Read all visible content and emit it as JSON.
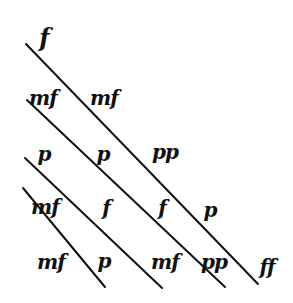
{
  "diagram": {
    "stroke_color": "#111111",
    "background": "#ffffff",
    "lines": [
      {
        "id": "line-1",
        "x1": 26,
        "y1": 44,
        "x2": 258,
        "y2": 284
      },
      {
        "id": "line-2",
        "x1": 27,
        "y1": 100,
        "x2": 225,
        "y2": 287
      },
      {
        "id": "line-3",
        "x1": 25,
        "y1": 158,
        "x2": 162,
        "y2": 288
      },
      {
        "id": "line-4",
        "x1": 23,
        "y1": 188,
        "x2": 105,
        "y2": 287
      }
    ],
    "marks": [
      {
        "text": "𝆑",
        "label": "f-top",
        "x": 44,
        "y": 38
      },
      {
        "text": "mf",
        "label": "mf-row1-col1",
        "x": 43,
        "y": 98
      },
      {
        "text": "mf",
        "label": "mf-row1-col2",
        "x": 104,
        "y": 98
      },
      {
        "text": "p",
        "label": "p-row2-col1",
        "x": 44,
        "y": 154
      },
      {
        "text": "p",
        "label": "p-row2-col2",
        "x": 103,
        "y": 154
      },
      {
        "text": "pp",
        "label": "pp-row2-col3",
        "x": 165,
        "y": 152
      },
      {
        "text": "mf",
        "label": "mf-row3-col1",
        "x": 45,
        "y": 207
      },
      {
        "text": "f",
        "label": "f-row3-col2",
        "x": 106,
        "y": 208
      },
      {
        "text": "f",
        "label": "f-row3-col3",
        "x": 162,
        "y": 208
      },
      {
        "text": "p",
        "label": "p-row3-col4",
        "x": 210,
        "y": 210
      },
      {
        "text": "mf",
        "label": "mf-row4-col1",
        "x": 51,
        "y": 262
      },
      {
        "text": "p",
        "label": "p-row4-col2",
        "x": 104,
        "y": 261
      },
      {
        "text": "mf",
        "label": "mf-row4-col3",
        "x": 165,
        "y": 262
      },
      {
        "text": "pp",
        "label": "pp-row4-col4",
        "x": 214,
        "y": 262
      },
      {
        "text": "ff",
        "label": "ff-bottom-right",
        "x": 267,
        "y": 267
      }
    ]
  }
}
